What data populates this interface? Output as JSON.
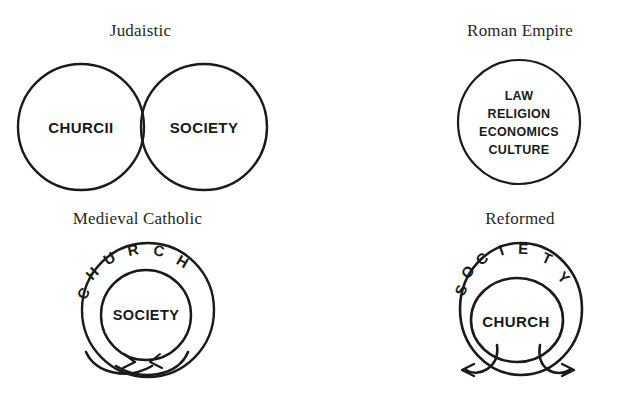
{
  "figure": {
    "background_color": "#ffffff",
    "ink_color": "#1a1a1a"
  },
  "panels": [
    {
      "id": "judaistic",
      "title": "Judaistic",
      "type": "two-tangent-circles",
      "labels": [
        "CHURCII",
        "SOCIETY"
      ],
      "left_label": "CHURCII",
      "right_label": "SOCIETY"
    },
    {
      "id": "roman-empire",
      "title": "Roman Empire",
      "type": "single-circle-with-list",
      "items": [
        "LAW",
        "RELIGION",
        "ECONOMICS",
        "CULTURE"
      ]
    },
    {
      "id": "medieval-catholic",
      "title": "Medieval Catholic",
      "type": "concentric-circles-with-arc-text",
      "outer_arc_label": "CHURCH",
      "inner_label": "SOCIETY",
      "arrows": "two-crossing-curved-arrows"
    },
    {
      "id": "reformed",
      "title": "Reformed",
      "type": "concentric-circles-with-arc-text",
      "outer_arc_label": "SOCIETY",
      "inner_label": "CHURCH",
      "arrows": "two-crossing-curved-arrows"
    }
  ]
}
